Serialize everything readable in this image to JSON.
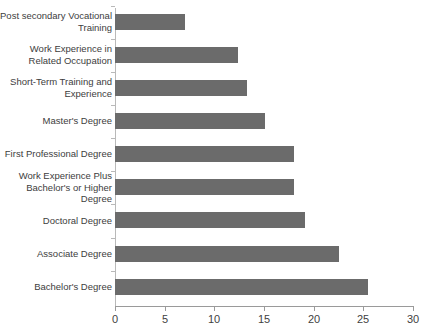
{
  "chart_data": {
    "type": "bar",
    "orientation": "horizontal",
    "title": "",
    "subtitle": "",
    "xlabel": "",
    "ylabel": "",
    "xlim": [
      0,
      30
    ],
    "xticks": [
      0,
      5,
      10,
      15,
      20,
      25,
      30
    ],
    "xtick_labels": [
      "0",
      "5",
      "10",
      "15",
      "20",
      "25",
      "30"
    ],
    "grid": false,
    "legend": false,
    "bar_color": "#6b6b6b",
    "axis_color": "#9a9a9a",
    "text_color": "#3d3d3d",
    "background": "#ffffff",
    "categories": [
      "Post secondary Vocational\nTraining",
      "Work Experience in\nRelated Occupation",
      "Short-Term Training and\nExperience",
      "Master's Degree",
      "First Professional Degree",
      "Work Experience Plus\nBachelor's or Higher Degree",
      "Doctoral Degree",
      "Associate Degree",
      "Bachelor's Degree"
    ],
    "values": [
      7.0,
      12.4,
      13.3,
      15.1,
      18.0,
      18.0,
      19.1,
      22.5,
      25.5
    ]
  }
}
